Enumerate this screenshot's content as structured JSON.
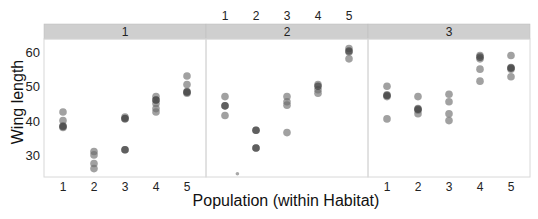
{
  "chart_data": {
    "type": "scatter",
    "title": "",
    "xlabel": "Population (within Habitat)",
    "ylabel": "Wing length",
    "ylim": [
      23,
      64
    ],
    "yticks": [
      30,
      40,
      50,
      60
    ],
    "ytick_labels": [
      "30",
      "40",
      "50",
      "60"
    ],
    "grid": false,
    "facet_by": "Habitat",
    "panels": [
      {
        "strip_label": "1",
        "categories": [
          "1",
          "2",
          "3",
          "4",
          "5"
        ],
        "tick_labels_position": "bottom",
        "points": [
          {
            "pop": 1,
            "values": [
              42.5,
              40,
              38.5,
              38
            ]
          },
          {
            "pop": 2,
            "values": [
              31,
              30,
              27.5,
              26
            ]
          },
          {
            "pop": 3,
            "values": [
              41,
              40.5,
              31.5
            ]
          },
          {
            "pop": 4,
            "values": [
              47,
              46,
              45,
              43.5,
              42.5
            ]
          },
          {
            "pop": 5,
            "values": [
              53,
              50.5,
              48.5,
              48
            ]
          }
        ],
        "overlaps": [
          {
            "pop": 1,
            "value": 38.3
          },
          {
            "pop": 3,
            "value": 31.5
          },
          {
            "pop": 3,
            "value": 40.6
          },
          {
            "pop": 4,
            "value": 46
          },
          {
            "pop": 5,
            "value": 48.3
          }
        ]
      },
      {
        "strip_label": "2",
        "categories": [
          "1",
          "2",
          "3",
          "4",
          "5"
        ],
        "tick_labels_position": "top",
        "points": [
          {
            "pop": 1,
            "values": [
              47,
              44.3,
              41.5
            ]
          },
          {
            "pop": 2,
            "values": [
              37.2,
              32
            ]
          },
          {
            "pop": 3,
            "values": [
              47,
              45.5,
              44.5,
              36.5
            ]
          },
          {
            "pop": 4,
            "values": [
              50.5,
              49,
              48
            ]
          },
          {
            "pop": 5,
            "values": [
              61,
              60,
              58
            ]
          }
        ],
        "overlaps": [
          {
            "pop": 1,
            "value": 44.3
          },
          {
            "pop": 2,
            "value": 37.2
          },
          {
            "pop": 2,
            "value": 32
          },
          {
            "pop": 4,
            "value": 50
          },
          {
            "pop": 5,
            "value": 60.3
          }
        ],
        "outliers": [
          {
            "pop": 1.4,
            "value": 24.5
          }
        ]
      },
      {
        "strip_label": "3",
        "categories": [
          "1",
          "2",
          "3",
          "4",
          "5"
        ],
        "tick_labels_position": "bottom",
        "points": [
          {
            "pop": 1,
            "values": [
              50,
              47.5,
              47,
              40.5
            ]
          },
          {
            "pop": 2,
            "values": [
              47,
              43.5,
              43,
              42
            ]
          },
          {
            "pop": 3,
            "values": [
              47.7,
              45.5,
              42,
              40
            ]
          },
          {
            "pop": 4,
            "values": [
              59,
              58,
              55,
              51.5
            ]
          },
          {
            "pop": 5,
            "values": [
              59,
              55.5,
              55,
              52.8
            ]
          }
        ],
        "overlaps": [
          {
            "pop": 1,
            "value": 47.3
          },
          {
            "pop": 2,
            "value": 43.3
          },
          {
            "pop": 4,
            "value": 58.5
          },
          {
            "pop": 5,
            "value": 55.3
          }
        ]
      }
    ],
    "colors": {
      "point": "#6e6e6e",
      "strip_fill": "#cfcfcf",
      "panel_border": "#d8d8d8",
      "text": "#222222"
    }
  }
}
